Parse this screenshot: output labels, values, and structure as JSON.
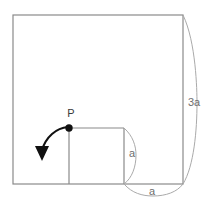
{
  "figure": {
    "background_color": "#ffffff",
    "stroke_color": "#8a8a8a",
    "label_color": "#6e6e6e",
    "accent_color": "#1a1a1a",
    "outer_square": {
      "name": "outer-square",
      "x": 13,
      "y": 15,
      "width": 170,
      "height": 169,
      "side_label": "3a"
    },
    "inner_square": {
      "name": "inner-square",
      "x": 69,
      "y": 128,
      "width": 55,
      "height": 56,
      "side_label": "a"
    },
    "point": {
      "name": "point-P",
      "label": "P",
      "cx": 69,
      "cy": 128,
      "r": 3.6,
      "label_x": 71,
      "label_y": 114
    },
    "rotation_arrow": {
      "name": "rotation-arrow",
      "direction": "counterclockwise",
      "start_x": 69,
      "start_y": 128,
      "tip_x": 42,
      "tip_y": 161
    },
    "dimensions": [
      {
        "id": "dim-3a",
        "label": "3a",
        "orientation": "vertical",
        "label_x": 194,
        "label_y": 103,
        "brace_from_x": 183,
        "brace_from_y": 15,
        "brace_to_x": 183,
        "brace_to_y": 184,
        "brace_bulge": 15
      },
      {
        "id": "dim-a-vertical",
        "label": "a",
        "orientation": "vertical",
        "label_x": 132,
        "label_y": 154,
        "brace_from_x": 124,
        "brace_from_y": 128,
        "brace_to_x": 124,
        "brace_to_y": 184,
        "brace_bulge": 12
      },
      {
        "id": "dim-a-horizontal",
        "label": "a",
        "orientation": "horizontal",
        "label_x": 152,
        "label_y": 192,
        "brace_from_x": 124,
        "brace_from_y": 184,
        "brace_to_x": 183,
        "brace_to_y": 184,
        "brace_bulge": 12
      }
    ]
  }
}
